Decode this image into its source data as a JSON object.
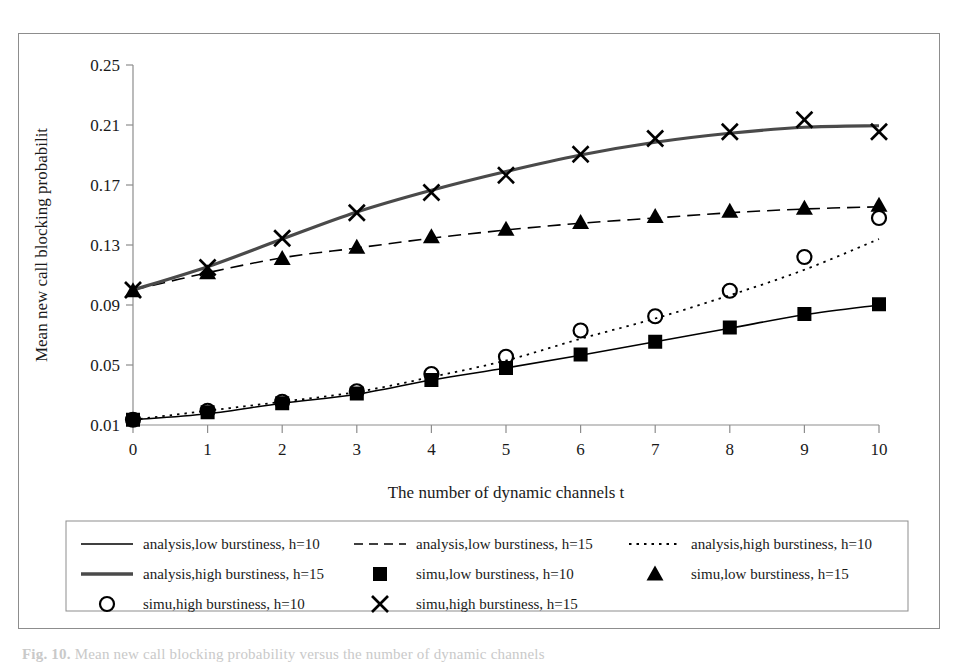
{
  "figure": {
    "caption_prefix": "Fig. 10.",
    "caption_text": "Mean new call blocking probability versus the number of dynamic channels"
  },
  "chart_data": {
    "type": "line",
    "title": "",
    "xlabel": "The number of dynamic channels t",
    "ylabel": "Mean new call blocking probabilit",
    "x": [
      0,
      1,
      2,
      3,
      4,
      5,
      6,
      7,
      8,
      9,
      10
    ],
    "xlim": [
      0,
      10
    ],
    "ylim": [
      0.01,
      0.25
    ],
    "yticks": [
      0.01,
      0.05,
      0.09,
      0.13,
      0.17,
      0.21,
      0.25
    ],
    "ytick_labels": [
      "0.01",
      "0.05",
      "0.09",
      "0.13",
      "0.17",
      "0.21",
      "0.25"
    ],
    "xticks": [
      0,
      1,
      2,
      3,
      4,
      5,
      6,
      7,
      8,
      9,
      10
    ],
    "xtick_labels": [
      "0",
      "1",
      "2",
      "3",
      "4",
      "5",
      "6",
      "7",
      "8",
      "9",
      "10"
    ],
    "grid": false,
    "legend_position": "below-plot",
    "series": [
      {
        "name": "analysis,low burstiness, h=10",
        "style": "solid",
        "width": 1.6,
        "marker": "none",
        "color": "#000000",
        "values": [
          0.0135,
          0.0175,
          0.0245,
          0.0305,
          0.04,
          0.048,
          0.0565,
          0.0655,
          0.0745,
          0.0835,
          0.09
        ]
      },
      {
        "name": "analysis,low burstiness, h=15",
        "style": "dashed",
        "width": 1.6,
        "marker": "none",
        "color": "#000000",
        "values": [
          0.1,
          0.1115,
          0.1215,
          0.128,
          0.1345,
          0.14,
          0.1445,
          0.148,
          0.1515,
          0.154,
          0.1555
        ]
      },
      {
        "name": "analysis,high burstiness, h=10",
        "style": "dotted",
        "width": 1.8,
        "marker": "none",
        "color": "#000000",
        "values": [
          0.0135,
          0.0195,
          0.0255,
          0.032,
          0.042,
          0.053,
          0.0675,
          0.081,
          0.0965,
          0.1135,
          0.134
        ]
      },
      {
        "name": "analysis,high burstiness, h=15",
        "style": "thick-solid",
        "width": 3.2,
        "marker": "none",
        "color": "#4a4a4a",
        "values": [
          0.1,
          0.1155,
          0.134,
          0.152,
          0.1665,
          0.179,
          0.19,
          0.1985,
          0.2045,
          0.2085,
          0.2095
        ]
      },
      {
        "name": "simu,low burstiness, h=10",
        "style": "none",
        "marker": "square",
        "color": "#000000",
        "values": [
          0.0135,
          0.0185,
          0.0245,
          0.031,
          0.04,
          0.048,
          0.057,
          0.0655,
          0.075,
          0.084,
          0.0905
        ]
      },
      {
        "name": "simu,low burstiness, h=15",
        "style": "none",
        "marker": "triangle",
        "color": "#000000",
        "values": [
          0.0995,
          0.1115,
          0.121,
          0.1285,
          0.1355,
          0.1405,
          0.145,
          0.149,
          0.1525,
          0.1545,
          0.1565
        ]
      },
      {
        "name": "simu,high burstiness, h=10",
        "style": "none",
        "marker": "circle",
        "color": "#000000",
        "values": [
          0.0135,
          0.0195,
          0.0255,
          0.0325,
          0.044,
          0.0555,
          0.073,
          0.0825,
          0.0995,
          0.122,
          0.148
        ]
      },
      {
        "name": "simu,high burstiness, h=15",
        "style": "none",
        "marker": "cross",
        "color": "#000000",
        "values": [
          0.1,
          0.115,
          0.1345,
          0.1515,
          0.165,
          0.1765,
          0.1905,
          0.201,
          0.2055,
          0.2135,
          0.2055
        ]
      }
    ]
  },
  "legend": {
    "rows": [
      [
        {
          "label": "analysis,low burstiness, h=10",
          "key": "solid"
        },
        {
          "label": "analysis,low burstiness, h=15",
          "key": "dashed"
        },
        {
          "label": "analysis,high burstiness, h=10",
          "key": "dotted"
        }
      ],
      [
        {
          "label": "analysis,high burstiness, h=15",
          "key": "thick-solid"
        },
        {
          "label": "simu,low burstiness, h=10",
          "key": "square"
        },
        {
          "label": "simu,low burstiness, h=15",
          "key": "triangle"
        }
      ],
      [
        {
          "label": "simu,high burstiness, h=10",
          "key": "circle"
        },
        {
          "label": "simu,high burstiness, h=15",
          "key": "cross"
        }
      ]
    ]
  }
}
